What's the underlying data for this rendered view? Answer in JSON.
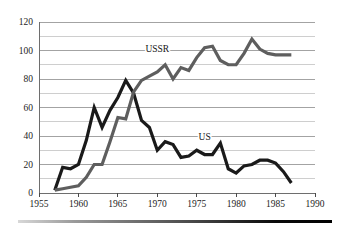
{
  "chart_data": {
    "type": "line",
    "title": "",
    "subtitle": "",
    "xlabel": "",
    "ylabel": "",
    "xlim": [
      1955,
      1990
    ],
    "ylim": [
      0,
      120
    ],
    "grid": true,
    "grid_minor_step": 10,
    "grid_major_step": 20,
    "legend_position": "inline-annotation",
    "x_ticks": [
      "1955",
      "1960",
      "1965",
      "1970",
      "1975",
      "1980",
      "1985",
      "1990"
    ],
    "x_tick_values": [
      1955,
      1960,
      1965,
      1970,
      1975,
      1980,
      1985,
      1990
    ],
    "y_ticks": [
      "0",
      "20",
      "40",
      "60",
      "80",
      "100",
      "120"
    ],
    "y_tick_values": [
      0,
      20,
      40,
      60,
      80,
      100,
      120
    ],
    "series": [
      {
        "name": "US",
        "label": "US",
        "color": "#1a1a1a",
        "stroke_width": 3.2,
        "label_x": 1976,
        "label_y": 37,
        "x": [
          1957,
          1958,
          1959,
          1960,
          1961,
          1962,
          1963,
          1964,
          1965,
          1966,
          1967,
          1968,
          1969,
          1970,
          1971,
          1972,
          1973,
          1974,
          1975,
          1976,
          1977,
          1978,
          1979,
          1980,
          1981,
          1982,
          1983,
          1984,
          1985,
          1986,
          1987
        ],
        "values": [
          2,
          18,
          17,
          20,
          37,
          60,
          46,
          58,
          67,
          79,
          70,
          51,
          46,
          30,
          36,
          34,
          25,
          26,
          30,
          27,
          27,
          35,
          17,
          14,
          19,
          20,
          23,
          23,
          21,
          15,
          7
        ]
      },
      {
        "name": "USSR",
        "label": "USSR",
        "color": "#5e5e5e",
        "stroke_width": 3.2,
        "label_x": 1970,
        "label_y": 99,
        "x": [
          1957,
          1958,
          1959,
          1960,
          1961,
          1962,
          1963,
          1964,
          1965,
          1966,
          1967,
          1968,
          1969,
          1970,
          1971,
          1972,
          1973,
          1974,
          1975,
          1976,
          1977,
          1978,
          1979,
          1980,
          1981,
          1982,
          1983,
          1984,
          1985,
          1986,
          1987
        ],
        "values": [
          2,
          3,
          4,
          5,
          11,
          20,
          20,
          36,
          53,
          52,
          71,
          79,
          82,
          85,
          90,
          80,
          88,
          86,
          95,
          102,
          103,
          93,
          90,
          90,
          98,
          108,
          101,
          98,
          97,
          97,
          97
        ]
      }
    ],
    "annotations": [
      {
        "text": "USSR",
        "x": 1970,
        "y": 99
      },
      {
        "text": "US",
        "x": 1976,
        "y": 37
      }
    ]
  },
  "footer": {
    "bar_name": "decorative-gradient-rule",
    "gradient_from": "#d8d8d8",
    "gradient_to": "#000000"
  },
  "colors": {
    "background": "#ffffff",
    "gridline": "#b9b9b9",
    "gridline_major": "#8c8c8c",
    "axis": "#6e6e6e",
    "text": "#1c1c1c",
    "us_series": "#1a1a1a",
    "ussr_series": "#5e5e5e"
  }
}
